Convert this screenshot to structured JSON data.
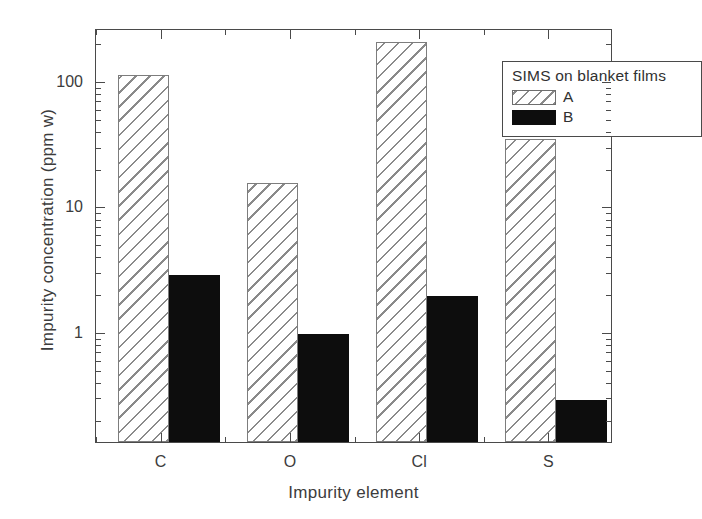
{
  "chart_data": {
    "type": "bar",
    "title": "",
    "xlabel": "Impurity element",
    "ylabel": "Impurity concentration (ppm w)",
    "categories": [
      "C",
      "O",
      "Cl",
      "S"
    ],
    "yscale": "log",
    "ylim": [
      0.13,
      260
    ],
    "ytick_labels": [
      "100",
      "10",
      "1"
    ],
    "ytick_values": [
      100,
      10,
      1
    ],
    "grid": false,
    "legend_position": "top-right",
    "legend_title": "SIMS on blanket films",
    "series": [
      {
        "name": "A",
        "style": "hatched",
        "values": [
          110,
          15,
          200,
          34
        ]
      },
      {
        "name": "B",
        "style": "solid-black",
        "values": [
          2.8,
          0.95,
          1.9,
          0.28
        ]
      }
    ],
    "colors": {
      "series_a_fill": "#ffffff",
      "series_a_hatch": "#8a8a8a",
      "series_b_fill": "#0d0d0d",
      "axis": "#4a4a4a",
      "text": "#3c3c3c"
    }
  },
  "legend": {
    "title": "SIMS on blanket films",
    "entries": [
      {
        "label": "A"
      },
      {
        "label": "B"
      }
    ]
  },
  "axes": {
    "x_title": "Impurity element",
    "y_title": "Impurity concentration (ppm w)"
  }
}
